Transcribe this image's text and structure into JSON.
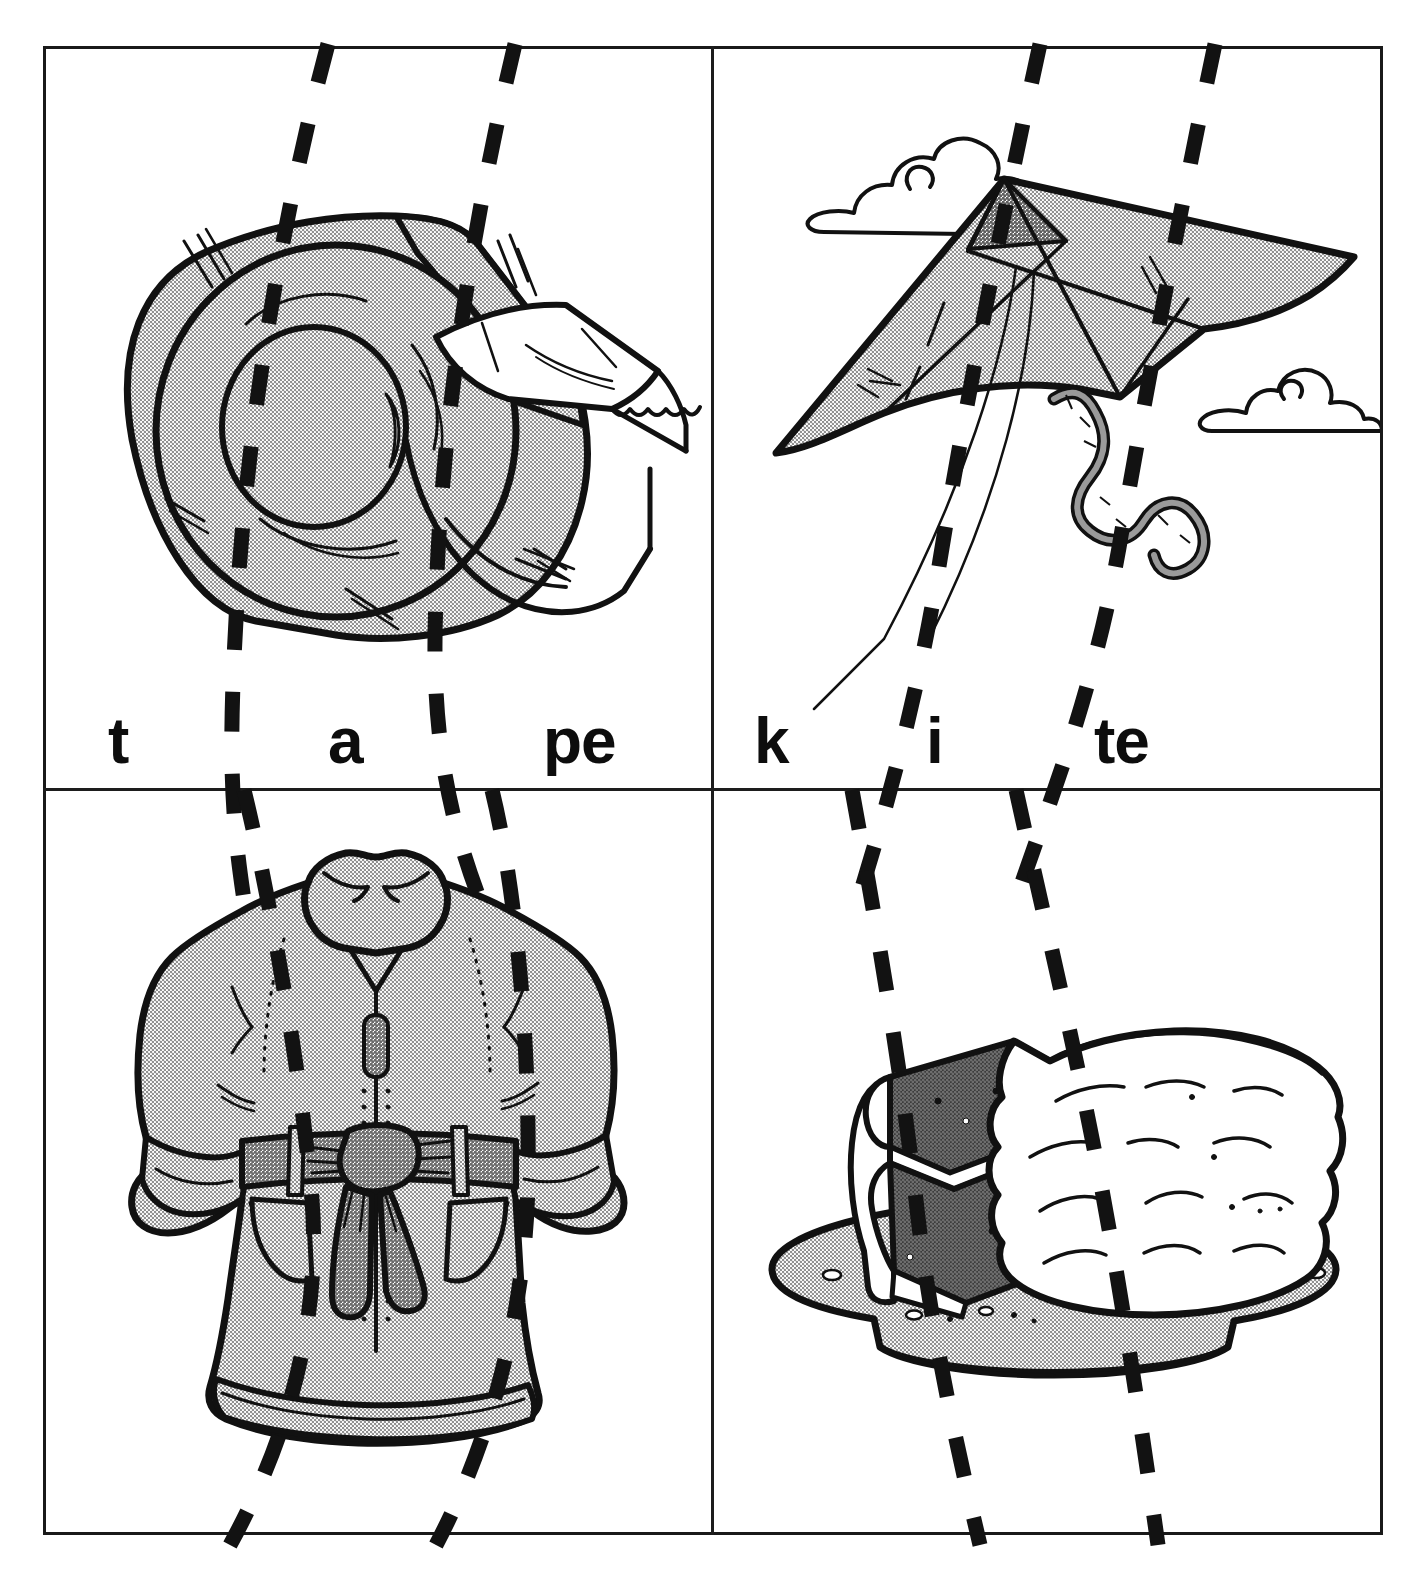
{
  "worksheet": {
    "title": "Phonics word-building cut-apart cards",
    "layout": "2x2 grid of picture cards",
    "background_color": "#ffffff",
    "frame_color": "#191919",
    "dash_color": "#121212",
    "fill_gray": "#cccccc",
    "mid_gray": "#9a9a9a",
    "dark_gray": "#4a4a4a"
  },
  "cards": [
    {
      "id": "tape",
      "picture": "tape-dispenser",
      "word": "tape",
      "segments": [
        "t",
        "a",
        "pe"
      ],
      "cut_lines": 2
    },
    {
      "id": "kite",
      "picture": "kite-with-clouds",
      "word": "kite",
      "segments": [
        "k",
        "i",
        "te"
      ],
      "cut_lines": 2
    },
    {
      "id": "coat",
      "picture": "winter-coat",
      "word": "coat",
      "segments": [
        "c",
        "oa",
        "t"
      ],
      "cut_lines": 2
    },
    {
      "id": "cake",
      "picture": "layer-cake-on-plate",
      "word": "cake",
      "segments": [
        "c",
        "a",
        "ke"
      ],
      "cut_lines": 2
    }
  ]
}
